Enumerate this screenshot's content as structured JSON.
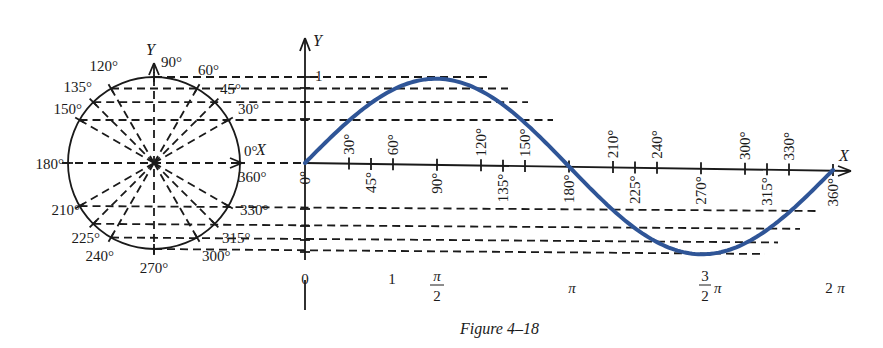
{
  "caption": "Figure 4–18",
  "colors": {
    "curve": "#2f5597",
    "ink": "#1a1a1a",
    "background": "#ffffff"
  },
  "circle": {
    "center": [
      154,
      163
    ],
    "radius": 86,
    "x_axis_label": "X",
    "y_axis_label": "Y",
    "angle_labels": [
      {
        "deg": 0,
        "text": "0°"
      },
      {
        "deg": 30,
        "text": "30°"
      },
      {
        "deg": 45,
        "text": "45°"
      },
      {
        "deg": 60,
        "text": "60°"
      },
      {
        "deg": 90,
        "text": "90°"
      },
      {
        "deg": 120,
        "text": "120°"
      },
      {
        "deg": 135,
        "text": "135°"
      },
      {
        "deg": 150,
        "text": "150°"
      },
      {
        "deg": 180,
        "text": "180°"
      },
      {
        "deg": 210,
        "text": "210°"
      },
      {
        "deg": 225,
        "text": "225°"
      },
      {
        "deg": 240,
        "text": "240°"
      },
      {
        "deg": 270,
        "text": "270°"
      },
      {
        "deg": 300,
        "text": "300°"
      },
      {
        "deg": 315,
        "text": "315°"
      },
      {
        "deg": 330,
        "text": "330°"
      },
      {
        "deg": 360,
        "text": "360°"
      }
    ]
  },
  "graph": {
    "origin": [
      305,
      163
    ],
    "x_end": 833,
    "amplitude_px": 86,
    "x_axis_label": "X",
    "y_axis_label": "Y",
    "y_tick_label": "1",
    "origin_label": "0",
    "upper_degree_labels": [
      "30°",
      "60°",
      "120°",
      "150°",
      "210°",
      "240°",
      "300°",
      "330°"
    ],
    "lower_degree_labels": [
      "0°",
      "45°",
      "90°",
      "135°",
      "180°",
      "225°",
      "270°",
      "315°",
      "360°"
    ],
    "radian_labels": [
      {
        "text": "0",
        "x": 305
      },
      {
        "text": "1",
        "x": 392
      },
      {
        "text": "π/2",
        "x": 437
      },
      {
        "text": "π",
        "x": 572
      },
      {
        "text": "3/2 π",
        "x": 705
      },
      {
        "text": "2π",
        "x": 837
      }
    ]
  },
  "chart_data": {
    "type": "line",
    "title": "Figure 4–18",
    "xlabel": "X",
    "ylabel": "Y",
    "x": [
      0,
      30,
      45,
      60,
      90,
      120,
      135,
      150,
      180,
      210,
      225,
      240,
      270,
      300,
      315,
      330,
      360
    ],
    "series": [
      {
        "name": "sin x",
        "values": [
          0,
          0.5,
          0.707,
          0.866,
          1,
          0.866,
          0.707,
          0.5,
          0,
          -0.5,
          -0.707,
          -0.866,
          -1,
          -0.866,
          -0.707,
          -0.5,
          0
        ]
      }
    ],
    "x_radian_ticks": [
      "0",
      "1",
      "π/2",
      "π",
      "3/2 π",
      "2π"
    ],
    "xlim": [
      0,
      360
    ],
    "ylim": [
      -1,
      1
    ],
    "grid": false
  }
}
